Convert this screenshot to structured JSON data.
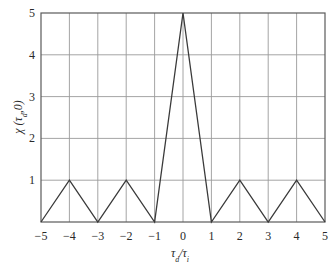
{
  "chart_data": {
    "type": "line",
    "title": "",
    "xlabel": "τd/τi",
    "ylabel": "χ (τd,0)",
    "xlim": [
      -5,
      5
    ],
    "ylim": [
      0,
      5
    ],
    "grid": true,
    "legend": null,
    "x_ticks": [
      "−5",
      "−4",
      "−3",
      "−2",
      "−1",
      "0",
      "1",
      "2",
      "3",
      "4",
      "5"
    ],
    "y_ticks": [
      "1",
      "2",
      "3",
      "4",
      "5"
    ],
    "series": [
      {
        "name": "ambiguity function",
        "x": [
          -5,
          -4,
          -3,
          -2,
          -1,
          0,
          1,
          2,
          3,
          4,
          5
        ],
        "y": [
          0,
          1,
          0,
          1,
          0,
          5,
          0,
          1,
          0,
          1,
          0
        ]
      }
    ],
    "colors": {
      "line": "#3a3a3a",
      "grid": "#9a9a9a",
      "frame": "#5a5a5a"
    }
  }
}
